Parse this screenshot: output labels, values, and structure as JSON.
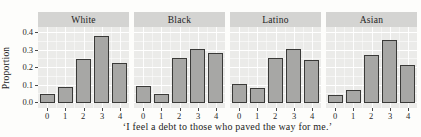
{
  "figure_title": "",
  "chart_data": {
    "type": "bar",
    "faceted": true,
    "facet_labels": [
      "White",
      "Black",
      "Latino",
      "Asian"
    ],
    "categories": [
      "0",
      "1",
      "2",
      "3",
      "4"
    ],
    "series": [
      {
        "name": "White",
        "values": [
          0.045,
          0.085,
          0.245,
          0.375,
          0.22
        ]
      },
      {
        "name": "Black",
        "values": [
          0.09,
          0.045,
          0.25,
          0.3,
          0.28
        ]
      },
      {
        "name": "Latino",
        "values": [
          0.1,
          0.08,
          0.25,
          0.3,
          0.24
        ]
      },
      {
        "name": "Asian",
        "values": [
          0.04,
          0.07,
          0.27,
          0.355,
          0.21
        ]
      }
    ],
    "title": "",
    "ylabel": "Proportion",
    "xlabel": "‘I feel a debt to those who paved the way for me.’",
    "ylim": [
      0,
      0.42
    ],
    "yticks": [
      0.0,
      0.1,
      0.2,
      0.3,
      0.4
    ],
    "ytick_labels": [
      "0.0",
      "0.1",
      "0.2",
      "0.3",
      "0.4"
    ],
    "minor_yticks": [
      0.05,
      0.15,
      0.25,
      0.35
    ],
    "grid": "white major and minor gridlines on grey panel",
    "legend": "none",
    "colors": {
      "panel_background": "#ebebe9",
      "strip_background": "#d4d4d2",
      "bar_fill": "#a7a7a5",
      "bar_outline": "#3a3a38",
      "grid_major": "#ffffff",
      "text": "#1e1e1e",
      "figure_background": "#fdfdfb"
    }
  }
}
